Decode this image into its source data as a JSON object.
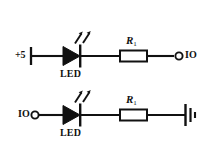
{
  "diagram": {
    "background_color": "#ffffff",
    "line_color": "#111111",
    "circuits": [
      {
        "id": "sourcing",
        "left_terminal_label": "+5",
        "left_terminal_type": "supply-post",
        "component_label": "LED",
        "resistor_label": "R",
        "resistor_subscript": "1",
        "right_terminal_label": "IO",
        "right_terminal_type": "open-circle"
      },
      {
        "id": "sinking",
        "left_terminal_label": "IO",
        "left_terminal_type": "open-circle",
        "component_label": "LED",
        "resistor_label": "R",
        "resistor_subscript": "1",
        "right_terminal_label": "",
        "right_terminal_type": "ground"
      }
    ]
  }
}
